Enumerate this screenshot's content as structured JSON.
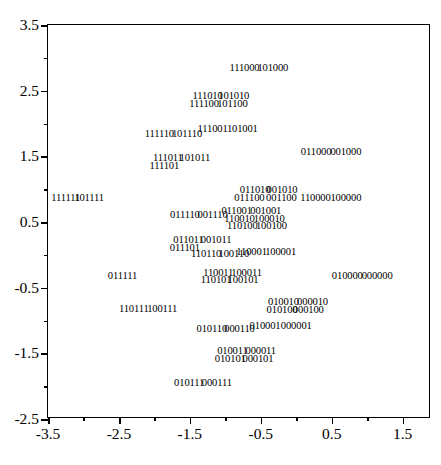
{
  "chart_data": {
    "type": "scatter",
    "title": "",
    "xlabel": "",
    "ylabel": "",
    "xlim": [
      -3.5,
      1.9
    ],
    "ylim": [
      -2.5,
      3.5
    ],
    "grid": false,
    "legend": null,
    "marker": "text-label",
    "xticks": [
      "-3.5",
      "-2.5",
      "-1.5",
      "-0.5",
      "0.5",
      "1.5"
    ],
    "xtick_values": [
      -3.5,
      -2.5,
      -1.5,
      -0.5,
      0.5,
      1.5
    ],
    "xminor_values": [
      -3.0,
      -2.0,
      -1.0,
      0.0,
      1.0
    ],
    "yticks": [
      "3.5",
      "2.5",
      "1.5",
      "0.5",
      "-0.5",
      "-1.5",
      "-2.5"
    ],
    "ytick_values": [
      3.5,
      2.5,
      1.5,
      0.5,
      -0.5,
      -1.5,
      -2.5
    ],
    "yminor_values": [
      3.0,
      2.0,
      1.0,
      0.0,
      -1.0,
      -2.0
    ],
    "points": [
      {
        "label": "111000",
        "x": -0.73,
        "y": 2.84
      },
      {
        "label": "101000",
        "x": -0.33,
        "y": 2.84
      },
      {
        "label": "111010",
        "x": -1.25,
        "y": 2.42
      },
      {
        "label": "101010",
        "x": -0.88,
        "y": 2.42
      },
      {
        "label": "111100",
        "x": -1.3,
        "y": 2.3
      },
      {
        "label": "101100",
        "x": -0.9,
        "y": 2.3
      },
      {
        "label": "111110",
        "x": -1.93,
        "y": 1.84
      },
      {
        "label": "101110",
        "x": -1.54,
        "y": 1.84
      },
      {
        "label": "111001",
        "x": -1.18,
        "y": 1.91
      },
      {
        "label": "101001",
        "x": -0.76,
        "y": 1.91
      },
      {
        "label": "011000",
        "x": 0.28,
        "y": 1.57
      },
      {
        "label": "001000",
        "x": 0.7,
        "y": 1.57
      },
      {
        "label": "111011",
        "x": -1.81,
        "y": 1.48
      },
      {
        "label": "101011",
        "x": -1.43,
        "y": 1.48
      },
      {
        "label": "111101",
        "x": -1.86,
        "y": 1.36
      },
      {
        "label": "011010",
        "x": -0.58,
        "y": 0.99
      },
      {
        "label": "001010",
        "x": -0.2,
        "y": 0.99
      },
      {
        "label": "011100",
        "x": -0.66,
        "y": 0.87
      },
      {
        "label": "001100",
        "x": -0.21,
        "y": 0.87
      },
      {
        "label": "110000",
        "x": 0.27,
        "y": 0.87
      },
      {
        "label": "100000",
        "x": 0.7,
        "y": 0.87
      },
      {
        "label": "111111",
        "x": -3.25,
        "y": 0.87
      },
      {
        "label": "101111",
        "x": -2.92,
        "y": 0.87
      },
      {
        "label": "011110",
        "x": -1.57,
        "y": 0.61
      },
      {
        "label": "001110",
        "x": -1.18,
        "y": 0.61
      },
      {
        "label": "011001",
        "x": -0.84,
        "y": 0.66
      },
      {
        "label": "001001",
        "x": -0.43,
        "y": 0.66
      },
      {
        "label": "110010",
        "x": -0.8,
        "y": 0.55
      },
      {
        "label": "100010",
        "x": -0.38,
        "y": 0.55
      },
      {
        "label": "110100",
        "x": -0.76,
        "y": 0.44
      },
      {
        "label": "100100",
        "x": -0.35,
        "y": 0.44
      },
      {
        "label": "011011",
        "x": -1.52,
        "y": 0.22
      },
      {
        "label": "001011",
        "x": -1.13,
        "y": 0.22
      },
      {
        "label": "011101",
        "x": -1.57,
        "y": 0.1
      },
      {
        "label": "110110",
        "x": -1.27,
        "y": 0.01
      },
      {
        "label": "100110",
        "x": -0.88,
        "y": 0.01
      },
      {
        "label": "110001",
        "x": -0.63,
        "y": 0.05
      },
      {
        "label": "100001",
        "x": -0.22,
        "y": 0.05
      },
      {
        "label": "011111",
        "x": -2.45,
        "y": -0.32
      },
      {
        "label": "110011",
        "x": -1.1,
        "y": -0.27
      },
      {
        "label": "100011",
        "x": -0.7,
        "y": -0.27
      },
      {
        "label": "110101",
        "x": -1.13,
        "y": -0.39
      },
      {
        "label": "100101",
        "x": -0.75,
        "y": -0.39
      },
      {
        "label": "010000",
        "x": 0.72,
        "y": -0.32
      },
      {
        "label": "000000",
        "x": 1.14,
        "y": -0.32
      },
      {
        "label": "010010",
        "x": -0.18,
        "y": -0.72
      },
      {
        "label": "000010",
        "x": 0.23,
        "y": -0.72
      },
      {
        "label": "010100",
        "x": -0.2,
        "y": -0.84
      },
      {
        "label": "000100",
        "x": 0.17,
        "y": -0.84
      },
      {
        "label": "110111",
        "x": -2.29,
        "y": -0.83
      },
      {
        "label": "100111",
        "x": -1.89,
        "y": -0.83
      },
      {
        "label": "010110",
        "x": -1.19,
        "y": -1.13
      },
      {
        "label": "000110",
        "x": -0.8,
        "y": -1.13
      },
      {
        "label": "010001",
        "x": -0.44,
        "y": -1.08
      },
      {
        "label": "000001",
        "x": 0.0,
        "y": -1.08
      },
      {
        "label": "010011",
        "x": -0.9,
        "y": -1.47
      },
      {
        "label": "000011",
        "x": -0.5,
        "y": -1.47
      },
      {
        "label": "010101",
        "x": -0.93,
        "y": -1.59
      },
      {
        "label": "000101",
        "x": -0.54,
        "y": -1.59
      },
      {
        "label": "010111",
        "x": -1.51,
        "y": -1.95
      },
      {
        "label": "000111",
        "x": -1.12,
        "y": -1.95
      }
    ]
  }
}
